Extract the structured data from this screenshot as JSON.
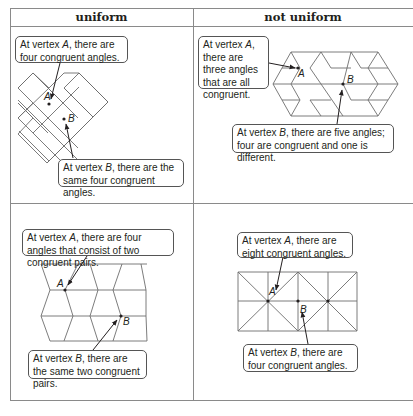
{
  "table": {
    "headers": [
      "uniform",
      "not uniform"
    ],
    "cells": [
      {
        "id": "uniform-square",
        "column": "uniform",
        "callout_a": {
          "prefix": "At vertex ",
          "vertex": "A",
          "suffix": ", there are four congruent angles."
        },
        "callout_b": {
          "prefix": "At vertex ",
          "vertex": "B",
          "suffix": ", there are the same four congruent angles."
        },
        "labels": {
          "a": "A",
          "b": "B"
        }
      },
      {
        "id": "not-uniform-rhombus",
        "column": "not uniform",
        "callout_a": {
          "prefix": "At vertex ",
          "vertex": "A",
          "suffix": ", there are three angles that are all congruent."
        },
        "callout_b": {
          "prefix": "At vertex ",
          "vertex": "B",
          "suffix": ", there are five angles; four are congruent and one is different."
        },
        "labels": {
          "a": "A",
          "b": "B"
        }
      },
      {
        "id": "uniform-chevron",
        "column": "uniform",
        "callout_a": {
          "prefix": "At vertex ",
          "vertex": "A",
          "suffix": ", there are four angles that consist of two congruent pairs."
        },
        "callout_b": {
          "prefix": "At vertex ",
          "vertex": "B",
          "suffix": ", there are the same two congruent pairs."
        },
        "labels": {
          "a": "A",
          "b": "B"
        }
      },
      {
        "id": "not-uniform-triangle",
        "column": "not uniform",
        "callout_a": {
          "prefix": "At vertex ",
          "vertex": "A",
          "suffix": ", there are eight congruent angles."
        },
        "callout_b": {
          "prefix": "At vertex ",
          "vertex": "B",
          "suffix": ", there are four congruent angles."
        },
        "labels": {
          "a": "A",
          "b": "B"
        }
      }
    ]
  }
}
